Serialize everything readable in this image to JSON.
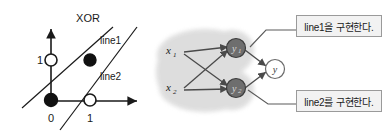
{
  "figure": {
    "left_plot": {
      "title": "XOR",
      "line_labels": {
        "line1": "line1",
        "line2": "line2"
      },
      "axis_ticks": {
        "origin": "0",
        "x_one": "1",
        "y_one": "1"
      },
      "points": [
        {
          "name": "point-0-0",
          "x": 0,
          "y": 0,
          "fill": "black"
        },
        {
          "name": "point-0-1",
          "x": 0,
          "y": 1,
          "fill": "white"
        },
        {
          "name": "point-1-0",
          "x": 1,
          "y": 0,
          "fill": "white"
        },
        {
          "name": "point-1-1",
          "x": 1,
          "y": 1,
          "fill": "black"
        }
      ]
    },
    "network": {
      "inputs": [
        {
          "label": "x",
          "subscript": "1"
        },
        {
          "label": "x",
          "subscript": "2"
        }
      ],
      "hidden": [
        {
          "label": "y",
          "subscript": "1"
        },
        {
          "label": "y",
          "subscript": "2"
        }
      ],
      "output": {
        "label": "y"
      }
    },
    "callouts": [
      {
        "text": "line1을 구현한다.",
        "target": "hidden-node-y1"
      },
      {
        "text": "line2를 구현한다.",
        "target": "hidden-node-y2"
      }
    ],
    "colors": {
      "stroke": "#1a1a1a",
      "blob": "#dcdcdc",
      "hidden_node": "#6e6e6e",
      "callout_bg": "#f2f2f2",
      "callout_border": "#9a9a9a"
    }
  }
}
